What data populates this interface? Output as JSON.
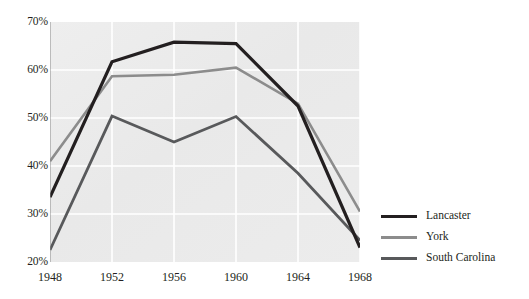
{
  "chart_data": {
    "type": "line",
    "title": "",
    "subtitle": "",
    "xlabel": "",
    "ylabel": "",
    "x": [
      1948,
      1952,
      1956,
      1960,
      1964,
      1968
    ],
    "categories": [
      "1948",
      "1952",
      "1956",
      "1960",
      "1964",
      "1968"
    ],
    "series": [
      {
        "name": "Lancaster",
        "color": "#231f20",
        "width": 3.2,
        "values": [
          33.5,
          61.7,
          65.8,
          65.5,
          52.5,
          23.0
        ]
      },
      {
        "name": "York",
        "color": "#8c8c8c",
        "width": 2.6,
        "values": [
          41.0,
          58.7,
          59.0,
          60.5,
          53.0,
          30.5
        ]
      },
      {
        "name": "South Carolina",
        "color": "#58595b",
        "width": 2.8,
        "values": [
          22.5,
          50.4,
          45.0,
          50.3,
          38.5,
          24.5
        ]
      }
    ],
    "ylim": [
      20,
      70
    ],
    "xlim": [
      1948,
      1968
    ],
    "yticks": [
      20,
      30,
      40,
      50,
      60,
      70
    ],
    "ytick_labels": [
      "20%",
      "30%",
      "40%",
      "50%",
      "60%",
      "70%"
    ],
    "xticks": [
      1948,
      1952,
      1956,
      1960,
      1964,
      1968
    ],
    "xtick_labels": [
      "1948",
      "1952",
      "1956",
      "1960",
      "1964",
      "1968"
    ],
    "grid": true,
    "grid_color": "#ffffff",
    "plot_background": "#ebebeb",
    "legend_position": "right",
    "legend_entries": [
      "Lancaster",
      "York",
      "South Carolina"
    ]
  },
  "axes": {
    "y_tick_labels": [
      "70%",
      "60%",
      "50%",
      "40%",
      "30%",
      "20%"
    ],
    "x_tick_labels": [
      "1948",
      "1952",
      "1956",
      "1960",
      "1964",
      "1968"
    ]
  },
  "legend": {
    "items": [
      {
        "label": "Lancaster",
        "color": "#231f20",
        "thickness": "3.4px"
      },
      {
        "label": "York",
        "color": "#8c8c8c",
        "thickness": "2.6px"
      },
      {
        "label": "South Carolina",
        "color": "#58595b",
        "thickness": "3.0px"
      }
    ]
  }
}
